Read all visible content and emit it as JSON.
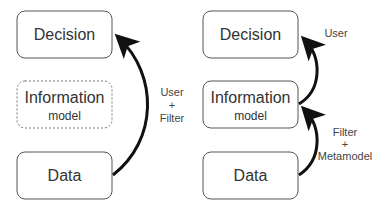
{
  "diagrams": [
    {
      "id": "left",
      "nodes": [
        {
          "id": "decision",
          "title": "Decision",
          "subtitle": "",
          "style": "solid"
        },
        {
          "id": "information",
          "title": "Information",
          "subtitle": "model",
          "style": "dashed"
        },
        {
          "id": "data",
          "title": "Data",
          "subtitle": "",
          "style": "solid"
        }
      ],
      "edges": [
        {
          "from": "data",
          "to": "decision",
          "label_lines": [
            "User",
            "+",
            "Filter"
          ]
        }
      ]
    },
    {
      "id": "right",
      "nodes": [
        {
          "id": "decision",
          "title": "Decision",
          "subtitle": "",
          "style": "solid"
        },
        {
          "id": "information",
          "title": "Information",
          "subtitle": "model",
          "style": "solid"
        },
        {
          "id": "data",
          "title": "Data",
          "subtitle": "",
          "style": "solid"
        }
      ],
      "edges": [
        {
          "from": "information",
          "to": "decision",
          "label_lines": [
            "User"
          ]
        },
        {
          "from": "data",
          "to": "information",
          "label_lines": [
            "Filter",
            "+",
            "Metamodel"
          ]
        }
      ]
    }
  ],
  "colors": {
    "stroke": "#555555",
    "arrow": "#111111",
    "text": "#333333",
    "background": "#ffffff"
  }
}
